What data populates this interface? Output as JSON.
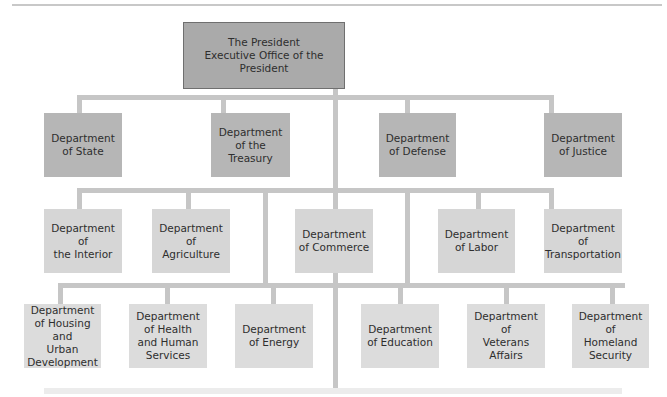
{
  "diagram": {
    "root": {
      "line1": "The President",
      "line2": "Executive Office of the President"
    },
    "tier1": [
      {
        "label": "Department\nof State"
      },
      {
        "label": "Department\nof the Treasury"
      },
      {
        "label": "Department\nof Defense"
      },
      {
        "label": "Department\nof Justice"
      }
    ],
    "tier2": [
      {
        "label": "Department of\nthe Interior"
      },
      {
        "label": "Department of\nAgriculture"
      },
      {
        "label": "Department\nof Commerce"
      },
      {
        "label": "Department\nof Labor"
      },
      {
        "label": "Department of\nTransportation"
      }
    ],
    "tier3": [
      {
        "label": "Department\nof Housing and\nUrban\nDevelopment"
      },
      {
        "label": "Department\nof Health\nand Human\nServices"
      },
      {
        "label": "Department\nof Energy"
      },
      {
        "label": "Department\nof Education"
      },
      {
        "label": "Department of\nVeterans\nAffairs"
      },
      {
        "label": "Department of\nHomeland\nSecurity"
      }
    ],
    "colors": {
      "root_fill": "#aaaaaa",
      "tier1_fill": "#b6b6b6",
      "tier2_fill": "#d6d6d6",
      "tier3_fill": "#dcdcdc",
      "connector": "#c6c6c6"
    }
  }
}
